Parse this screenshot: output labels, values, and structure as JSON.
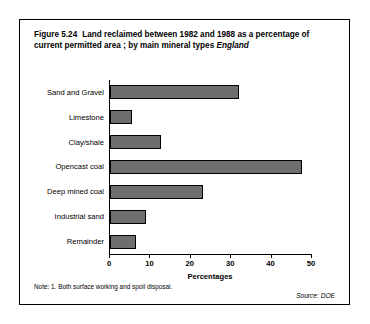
{
  "figure": {
    "number": "Figure 5.24",
    "title": "Land reclaimed between 1982 and 1988 as a percentage of current permitted area ; by main mineral types",
    "region": "England",
    "note": "Note: 1.  Both surface working and spoil disposal.",
    "source": "Source:  DOE"
  },
  "chart_data": {
    "type": "bar",
    "orientation": "horizontal",
    "title": "Land reclaimed between 1982 and 1988 as a percentage of current permitted area ; by main mineral types",
    "subtitle": "England",
    "xlabel": "Percentages",
    "ylabel": "",
    "xlim": [
      0,
      50
    ],
    "xticks": [
      0,
      10,
      20,
      30,
      40,
      50
    ],
    "xtick_labels": [
      "0",
      "10",
      "20",
      "30",
      "40",
      "50"
    ],
    "grid": false,
    "legend": false,
    "bar_color": "#6e6e6e",
    "categories": [
      "Sand and Gravel",
      "Limestone",
      "Clay/shale",
      "Opencast coal",
      "Deep mined coal",
      "Industrial sand",
      "Remainder"
    ],
    "values": [
      32,
      5.5,
      12.5,
      47.5,
      23,
      9,
      6.5
    ]
  }
}
